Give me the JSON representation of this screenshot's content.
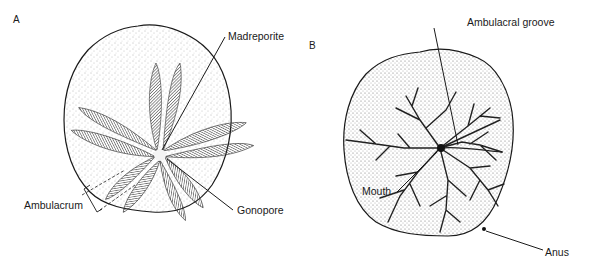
{
  "figure": {
    "panels": [
      {
        "id": "A",
        "label": "A",
        "view": "aboral surface of sand dollar",
        "callouts": [
          {
            "text": "Madreporite"
          },
          {
            "text": "Gonopore"
          },
          {
            "text": "Ambulacrum"
          }
        ]
      },
      {
        "id": "B",
        "label": "B",
        "view": "oral surface of sand dollar",
        "callouts": [
          {
            "text": "Ambulacral groove"
          },
          {
            "text": "Mouth"
          },
          {
            "text": "Anus"
          }
        ]
      }
    ],
    "colors": {
      "ink": "#1a1a1a",
      "stipple": "#8a8a8a",
      "background": "#ffffff"
    }
  }
}
